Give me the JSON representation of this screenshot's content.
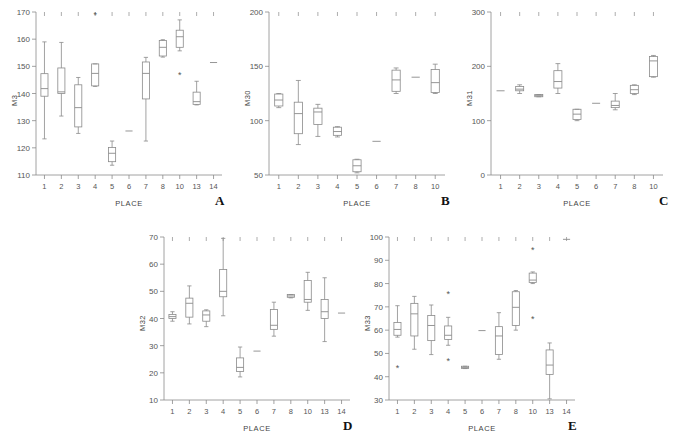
{
  "figure": {
    "background": "#ffffff",
    "line_color": "#8a8a8a",
    "text_color": "#555555",
    "xlabel": "PLACE"
  },
  "chart_data": [
    {
      "type": "box",
      "panel": "A",
      "title": "",
      "xlabel": "PLACE",
      "ylabel": "M3",
      "ylim": [
        110,
        170
      ],
      "yticks": [
        110,
        120,
        130,
        140,
        150,
        160,
        170
      ],
      "grid": false,
      "categories": [
        "1",
        "2",
        "3",
        "4",
        "5",
        "6",
        "7",
        "8",
        "10",
        "13",
        "14"
      ],
      "boxes": [
        {
          "x": "1",
          "min": 123.3,
          "q1": 139.0,
          "med": 141.8,
          "q3": 147.3,
          "max": 159.0,
          "outliers": []
        },
        {
          "x": "2",
          "min": 131.7,
          "q1": 140.0,
          "med": 140.6,
          "q3": 149.4,
          "max": 158.8,
          "outliers": []
        },
        {
          "x": "3",
          "min": 125.3,
          "q1": 127.7,
          "med": 134.8,
          "q3": 143.2,
          "max": 145.9,
          "outliers": []
        },
        {
          "x": "4",
          "min": 142.6,
          "q1": 142.8,
          "med": 147.4,
          "q3": 150.9,
          "max": 150.9,
          "outliers": [
            169.0
          ]
        },
        {
          "x": "5",
          "min": 113.6,
          "q1": 114.9,
          "med": 118.0,
          "q3": 120.1,
          "max": 122.5,
          "outliers": []
        },
        {
          "x": "6",
          "min": 126.2,
          "q1": 126.2,
          "med": 126.2,
          "q3": 126.2,
          "max": 126.2,
          "outliers": []
        },
        {
          "x": "7",
          "min": 122.5,
          "q1": 138.0,
          "med": 147.4,
          "q3": 151.6,
          "max": 153.3,
          "outliers": []
        },
        {
          "x": "8",
          "min": 153.4,
          "q1": 153.8,
          "med": 157.0,
          "q3": 159.5,
          "max": 159.8,
          "outliers": []
        },
        {
          "x": "10",
          "min": 155.7,
          "q1": 157.0,
          "med": 160.9,
          "q3": 163.3,
          "max": 167.1,
          "outliers": [
            147.0
          ]
        },
        {
          "x": "13",
          "min": 135.8,
          "q1": 136.0,
          "med": 137.0,
          "q3": 140.5,
          "max": 144.5,
          "outliers": []
        },
        {
          "x": "14",
          "min": 151.4,
          "q1": 151.4,
          "med": 151.4,
          "q3": 151.4,
          "max": 151.4,
          "outliers": []
        }
      ]
    },
    {
      "type": "box",
      "panel": "B",
      "title": "",
      "xlabel": "PLACE",
      "ylabel": "M30",
      "ylim": [
        50,
        200
      ],
      "yticks": [
        50,
        100,
        150,
        200
      ],
      "grid": false,
      "categories": [
        "1",
        "2",
        "3",
        "4",
        "5",
        "6",
        "7",
        "8",
        "10"
      ],
      "boxes": [
        {
          "x": "1",
          "min": 112.0,
          "q1": 113.5,
          "med": 119.0,
          "q3": 124.5,
          "max": 125.0,
          "outliers": []
        },
        {
          "x": "2",
          "min": 78.0,
          "q1": 88.0,
          "med": 106.5,
          "q3": 117.0,
          "max": 137.0,
          "outliers": []
        },
        {
          "x": "3",
          "min": 85.5,
          "q1": 96.5,
          "med": 108.0,
          "q3": 111.5,
          "max": 115.0,
          "outliers": []
        },
        {
          "x": "4",
          "min": 85.0,
          "q1": 86.5,
          "med": 90.0,
          "q3": 94.0,
          "max": 94.5,
          "outliers": []
        },
        {
          "x": "5",
          "min": 52.0,
          "q1": 53.0,
          "med": 58.5,
          "q3": 64.0,
          "max": 64.5,
          "outliers": []
        },
        {
          "x": "6",
          "min": 81.0,
          "q1": 81.0,
          "med": 81.0,
          "q3": 81.0,
          "max": 81.0,
          "outliers": []
        },
        {
          "x": "7",
          "min": 125.0,
          "q1": 127.0,
          "med": 137.5,
          "q3": 146.5,
          "max": 148.5,
          "outliers": []
        },
        {
          "x": "8",
          "min": 140.0,
          "q1": 140.0,
          "med": 140.0,
          "q3": 140.0,
          "max": 140.0,
          "outliers": []
        },
        {
          "x": "10",
          "min": 125.0,
          "q1": 126.0,
          "med": 135.0,
          "q3": 147.0,
          "max": 152.0,
          "outliers": []
        }
      ]
    },
    {
      "type": "box",
      "panel": "C",
      "title": "",
      "xlabel": "PLACE",
      "ylabel": "M31",
      "ylim": [
        0,
        300
      ],
      "yticks": [
        0,
        100,
        200,
        300
      ],
      "grid": false,
      "categories": [
        "1",
        "2",
        "3",
        "4",
        "5",
        "6",
        "7",
        "8",
        "10"
      ],
      "boxes": [
        {
          "x": "1",
          "min": 155.0,
          "q1": 155.0,
          "med": 155.0,
          "q3": 155.0,
          "max": 155.0,
          "outliers": []
        },
        {
          "x": "2",
          "min": 150.0,
          "q1": 155.0,
          "med": 158.0,
          "q3": 163.0,
          "max": 166.0,
          "outliers": []
        },
        {
          "x": "3",
          "min": 144.0,
          "q1": 144.0,
          "med": 146.0,
          "q3": 148.0,
          "max": 148.0,
          "outliers": []
        },
        {
          "x": "4",
          "min": 150.0,
          "q1": 160.0,
          "med": 172.0,
          "q3": 192.0,
          "max": 205.0,
          "outliers": []
        },
        {
          "x": "5",
          "min": 100.0,
          "q1": 102.0,
          "med": 112.0,
          "q3": 121.0,
          "max": 121.0,
          "outliers": []
        },
        {
          "x": "6",
          "min": 132.0,
          "q1": 132.0,
          "med": 132.0,
          "q3": 132.0,
          "max": 132.0,
          "outliers": []
        },
        {
          "x": "7",
          "min": 120.0,
          "q1": 124.0,
          "med": 128.0,
          "q3": 136.0,
          "max": 150.0,
          "outliers": []
        },
        {
          "x": "8",
          "min": 148.0,
          "q1": 150.0,
          "med": 157.0,
          "q3": 165.0,
          "max": 166.0,
          "outliers": []
        },
        {
          "x": "10",
          "min": 180.0,
          "q1": 181.0,
          "med": 210.0,
          "q3": 218.0,
          "max": 220.0,
          "outliers": []
        }
      ]
    },
    {
      "type": "box",
      "panel": "D",
      "title": "",
      "xlabel": "PLACE",
      "ylabel": "M32",
      "ylim": [
        10,
        70
      ],
      "yticks": [
        10,
        20,
        30,
        40,
        50,
        60,
        70
      ],
      "grid": false,
      "categories": [
        "1",
        "2",
        "3",
        "4",
        "5",
        "6",
        "7",
        "8",
        "10",
        "13",
        "14"
      ],
      "boxes": [
        {
          "x": "1",
          "min": 39.0,
          "q1": 40.0,
          "med": 40.7,
          "q3": 41.5,
          "max": 42.5,
          "outliers": []
        },
        {
          "x": "2",
          "min": 38.0,
          "q1": 40.5,
          "med": 45.6,
          "q3": 47.5,
          "max": 52.0,
          "outliers": []
        },
        {
          "x": "3",
          "min": 37.0,
          "q1": 39.0,
          "med": 41.3,
          "q3": 42.8,
          "max": 43.2,
          "outliers": []
        },
        {
          "x": "4",
          "min": 41.0,
          "q1": 48.0,
          "med": 50.0,
          "q3": 58.0,
          "max": 69.5,
          "outliers": []
        },
        {
          "x": "5",
          "min": 18.5,
          "q1": 20.5,
          "med": 22.0,
          "q3": 25.5,
          "max": 29.5,
          "outliers": []
        },
        {
          "x": "6",
          "min": 28.0,
          "q1": 28.0,
          "med": 28.0,
          "q3": 28.0,
          "max": 28.0,
          "outliers": []
        },
        {
          "x": "7",
          "min": 33.5,
          "q1": 36.0,
          "med": 37.5,
          "q3": 43.3,
          "max": 46.0,
          "outliers": []
        },
        {
          "x": "8",
          "min": 47.6,
          "q1": 47.8,
          "med": 48.3,
          "q3": 48.8,
          "max": 48.8,
          "outliers": []
        },
        {
          "x": "10",
          "min": 43.0,
          "q1": 46.0,
          "med": 47.0,
          "q3": 54.0,
          "max": 57.0,
          "outliers": []
        },
        {
          "x": "13",
          "min": 31.5,
          "q1": 40.0,
          "med": 42.5,
          "q3": 47.0,
          "max": 55.0,
          "outliers": []
        },
        {
          "x": "14",
          "min": 42.0,
          "q1": 42.0,
          "med": 42.0,
          "q3": 42.0,
          "max": 42.0,
          "outliers": []
        }
      ]
    },
    {
      "type": "box",
      "panel": "E",
      "title": "",
      "xlabel": "PLACE",
      "ylabel": "M33",
      "ylim": [
        30,
        100
      ],
      "yticks": [
        30,
        40,
        50,
        60,
        70,
        80,
        90,
        100
      ],
      "grid": false,
      "categories": [
        "1",
        "2",
        "3",
        "4",
        "5",
        "6",
        "7",
        "8",
        "10",
        "13",
        "14"
      ],
      "boxes": [
        {
          "x": "1",
          "min": 57.0,
          "q1": 57.8,
          "med": 60.3,
          "q3": 63.3,
          "max": 70.5,
          "outliers": [
            44.0
          ]
        },
        {
          "x": "2",
          "min": 51.8,
          "q1": 57.5,
          "med": 67.0,
          "q3": 71.5,
          "max": 74.5,
          "outliers": []
        },
        {
          "x": "3",
          "min": 49.5,
          "q1": 55.5,
          "med": 62.0,
          "q3": 66.3,
          "max": 70.8,
          "outliers": []
        },
        {
          "x": "4",
          "min": 53.5,
          "q1": 56.0,
          "med": 57.8,
          "q3": 61.8,
          "max": 65.5,
          "outliers": [
            75.5,
            47.0
          ]
        },
        {
          "x": "5",
          "min": 43.5,
          "q1": 43.5,
          "med": 44.0,
          "q3": 44.5,
          "max": 44.5,
          "outliers": []
        },
        {
          "x": "6",
          "min": 59.8,
          "q1": 59.8,
          "med": 59.8,
          "q3": 59.8,
          "max": 59.8,
          "outliers": []
        },
        {
          "x": "7",
          "min": 47.5,
          "q1": 49.5,
          "med": 57.5,
          "q3": 61.5,
          "max": 67.5,
          "outliers": []
        },
        {
          "x": "8",
          "min": 60.0,
          "q1": 62.0,
          "med": 69.8,
          "q3": 76.5,
          "max": 77.0,
          "outliers": []
        },
        {
          "x": "10",
          "min": 80.0,
          "q1": 80.5,
          "med": 81.5,
          "q3": 84.5,
          "max": 85.0,
          "outliers": [
            94.5,
            65.0
          ]
        },
        {
          "x": "13",
          "min": 30.5,
          "q1": 41.0,
          "med": 45.0,
          "q3": 51.5,
          "max": 54.5,
          "outliers": []
        },
        {
          "x": "14",
          "min": 99.0,
          "q1": 99.0,
          "med": 99.0,
          "q3": 99.0,
          "max": 99.0,
          "outliers": []
        }
      ]
    }
  ],
  "panels": [
    {
      "letter": "A",
      "ylabel": "M3"
    },
    {
      "letter": "B",
      "ylabel": "M30"
    },
    {
      "letter": "C",
      "ylabel": "M31"
    },
    {
      "letter": "D",
      "ylabel": "M32"
    },
    {
      "letter": "E",
      "ylabel": "M33"
    }
  ]
}
